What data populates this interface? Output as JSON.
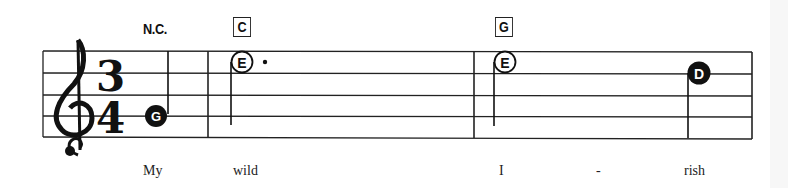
{
  "score": {
    "clef": "treble",
    "time_signature": {
      "top": "3",
      "bottom": "4"
    },
    "no_chord_label": "N.C.",
    "chords": [
      {
        "label": "C",
        "measure": 2
      },
      {
        "label": "G",
        "measure": 3
      }
    ],
    "notes": [
      {
        "letter": "G",
        "style": "filled",
        "duration": "quarter",
        "measure": 1
      },
      {
        "letter": "E",
        "style": "open",
        "duration": "dotted-half",
        "measure": 2
      },
      {
        "letter": "E",
        "style": "open",
        "duration": "half",
        "measure": 3
      },
      {
        "letter": "D",
        "style": "filled",
        "duration": "quarter",
        "measure": 3
      }
    ],
    "lyrics": [
      "My",
      "wild",
      "I",
      "-",
      "rish"
    ]
  }
}
